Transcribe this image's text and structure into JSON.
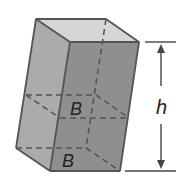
{
  "figure": {
    "type": "oblique rectangular prism",
    "labels": {
      "base_upper": "B",
      "base_lower": "B",
      "height": "h"
    },
    "colors": {
      "front_face": "#8f8f8f",
      "left_face": "#ababab",
      "top_face": "#d6d6d6",
      "edge": "#555555",
      "hidden_edge": "#555555"
    }
  }
}
